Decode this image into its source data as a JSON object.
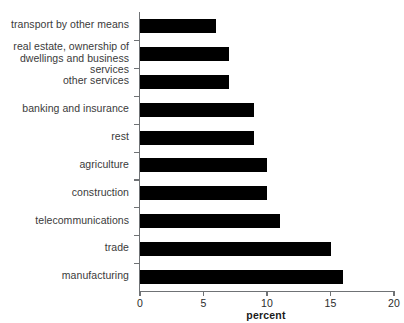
{
  "chart_data": {
    "type": "bar",
    "orientation": "horizontal",
    "title": "",
    "xlabel": "percent",
    "ylabel": "",
    "xlim": [
      0,
      20
    ],
    "xticks": [
      0,
      5,
      10,
      15,
      20
    ],
    "xtick_labels": [
      "0",
      "5",
      "10",
      "15",
      "20"
    ],
    "grid": false,
    "legend": false,
    "bar_color": "#000000",
    "axis_color": "#6f7275",
    "background_color": "#ffffff",
    "categories": [
      "transport by other means",
      "real estate, ownership of\ndwellings and business services",
      "other services",
      "banking and insurance",
      "rest",
      "agriculture",
      "construction",
      "telecommunications",
      "trade",
      "manufacturing"
    ],
    "values": [
      6,
      7,
      7,
      9,
      9,
      10,
      10,
      11,
      15,
      16
    ],
    "series": [
      {
        "name": "percent",
        "values": [
          6,
          7,
          7,
          9,
          9,
          10,
          10,
          11,
          15,
          16
        ]
      }
    ]
  }
}
